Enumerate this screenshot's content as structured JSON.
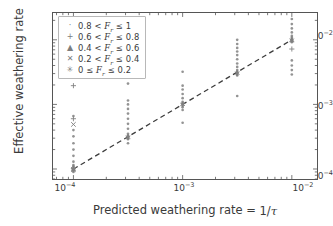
{
  "chart_data": {
    "type": "scatter",
    "title": "",
    "xlabel": "Predicted weathering rate = 1/τ",
    "ylabel": "Effective weathering rate",
    "xscale": "log",
    "yscale": "log",
    "xlim": [
      6.5e-05,
      0.017
    ],
    "ylim": [
      7e-05,
      0.026
    ],
    "grid": false,
    "xticks": [
      0.0001,
      0.001,
      0.01
    ],
    "xtick_labels": [
      "10⁻⁴",
      "10⁻³",
      "10⁻²"
    ],
    "yticks": [
      0.0001,
      0.001,
      0.01
    ],
    "ytick_labels": [
      "10⁻⁴",
      "10⁻³",
      "10⁻²"
    ],
    "legend_position": "upper left",
    "reference_line": {
      "style": "dashed",
      "color": "#3c3c3c",
      "description": "one-to-one line y = x",
      "x": [
        0.0001,
        0.01
      ],
      "y": [
        0.0001,
        0.01
      ]
    },
    "marker_color": "#808080",
    "series": [
      {
        "name": "0.8 < F_r ≤ 1",
        "marker": "point",
        "glyph": "·",
        "points": [
          [
            0.0001,
            0.0001
          ],
          [
            0.0001,
            0.000105
          ],
          [
            0.0001,
            9.3e-05
          ],
          [
            0.0001,
            0.00011
          ],
          [
            0.0001,
            9.7e-05
          ],
          [
            0.0001,
            0.0001
          ],
          [
            0.0001,
            0.000115
          ],
          [
            0.0001,
            9e-05
          ],
          [
            0.0001,
            0.00013
          ],
          [
            0.0001,
            0.00016
          ],
          [
            0.0001,
            0.0002
          ],
          [
            0.0001,
            0.00025
          ],
          [
            0.0001,
            0.00032
          ],
          [
            0.0001,
            0.0004
          ],
          [
            0.0001,
            0.00066
          ],
          [
            0.000316,
            0.00031
          ],
          [
            0.000316,
            0.00032
          ],
          [
            0.000316,
            0.0003
          ],
          [
            0.000316,
            0.00033
          ],
          [
            0.000316,
            0.00029
          ],
          [
            0.000316,
            0.000315
          ],
          [
            0.000316,
            0.00025
          ],
          [
            0.000316,
            0.00035
          ],
          [
            0.000316,
            0.00042
          ],
          [
            0.000316,
            0.0005
          ],
          [
            0.000316,
            0.0006
          ],
          [
            0.000316,
            0.00072
          ],
          [
            0.000316,
            0.00085
          ],
          [
            0.000316,
            0.001
          ],
          [
            0.000316,
            0.00115
          ],
          [
            0.000316,
            0.0021
          ],
          [
            0.001,
            0.001
          ],
          [
            0.001,
            0.00102
          ],
          [
            0.001,
            0.00095
          ],
          [
            0.001,
            0.00105
          ],
          [
            0.001,
            0.0009
          ],
          [
            0.001,
            0.0011
          ],
          [
            0.001,
            0.00082
          ],
          [
            0.001,
            0.00125
          ],
          [
            0.001,
            0.00145
          ],
          [
            0.001,
            0.0017
          ],
          [
            0.001,
            0.00195
          ],
          [
            0.001,
            0.0032
          ],
          [
            0.001,
            0.00052
          ],
          [
            0.00316,
            0.003
          ],
          [
            0.00316,
            0.0031
          ],
          [
            0.00316,
            0.0029
          ],
          [
            0.00316,
            0.0032
          ],
          [
            0.00316,
            0.0028
          ],
          [
            0.00316,
            0.0034
          ],
          [
            0.00316,
            0.0038
          ],
          [
            0.00316,
            0.0043
          ],
          [
            0.00316,
            0.005
          ],
          [
            0.00316,
            0.0058
          ],
          [
            0.00316,
            0.0066
          ],
          [
            0.00316,
            0.0075
          ],
          [
            0.00316,
            0.0086
          ],
          [
            0.00316,
            0.01
          ],
          [
            0.00316,
            0.00135
          ],
          [
            0.01,
            0.01
          ],
          [
            0.01,
            0.0102
          ],
          [
            0.01,
            0.0096
          ],
          [
            0.01,
            0.0108
          ],
          [
            0.01,
            0.0092
          ],
          [
            0.01,
            0.0115
          ],
          [
            0.01,
            0.013
          ],
          [
            0.01,
            0.015
          ],
          [
            0.01,
            0.0175
          ],
          [
            0.01,
            0.021
          ],
          [
            0.01,
            0.0048
          ],
          [
            0.01,
            0.004
          ],
          [
            0.01,
            0.0034
          ],
          [
            0.01,
            0.0029
          ]
        ]
      },
      {
        "name": "0.6 < F_r ≤ 0.8",
        "marker": "plus",
        "glyph": "+",
        "points": [
          [
            0.0001,
            0.00195
          ],
          [
            0.0001,
            0.0006
          ],
          [
            0.0001,
            0.000102
          ],
          [
            0.01,
            0.0072
          ]
        ]
      },
      {
        "name": "0.4 < F_r ≤ 0.6",
        "marker": "triangle",
        "glyph": "▲",
        "points": [
          [
            0.0001,
            0.0001
          ],
          [
            0.01,
            0.0098
          ]
        ]
      },
      {
        "name": "0.2 < F_r ≤ 0.4",
        "marker": "x",
        "glyph": "✕",
        "points": [
          [
            0.0001,
            0.00049
          ],
          [
            0.0001,
            9.8e-05
          ]
        ]
      },
      {
        "name": "0 ≤ F_r ≤ 0.2",
        "marker": "star",
        "glyph": "✳",
        "points": [
          [
            0.0001,
            0.0001
          ],
          [
            0.000316,
            0.00031
          ],
          [
            0.001,
            0.001
          ],
          [
            0.00316,
            0.00305
          ],
          [
            0.01,
            0.0099
          ]
        ]
      }
    ]
  },
  "axes": {
    "ylabel": "Effective weathering rate",
    "xlabel_prefix": "Predicted weathering rate = ",
    "xlabel_numerator": "1",
    "xlabel_denominator": "τ",
    "ytick_labels": [
      {
        "mantissa": "10",
        "exponent": "−2"
      },
      {
        "mantissa": "10",
        "exponent": "−3"
      },
      {
        "mantissa": "10",
        "exponent": "−4"
      }
    ],
    "xtick_labels": [
      {
        "mantissa": "10",
        "exponent": "−4"
      },
      {
        "mantissa": "10",
        "exponent": "−3"
      },
      {
        "mantissa": "10",
        "exponent": "−2"
      }
    ]
  },
  "legend": {
    "entries": [
      {
        "glyph": "·",
        "prefix": "0.8 <",
        "var": "F",
        "sub": "r",
        "rel": " ≤ 1"
      },
      {
        "glyph": "+",
        "prefix": "0.6 <",
        "var": "F",
        "sub": "r",
        "rel": " ≤ 0.8"
      },
      {
        "glyph": "▲",
        "prefix": "0.4 <",
        "var": "F",
        "sub": "r",
        "rel": " ≤ 0.6"
      },
      {
        "glyph": "✕",
        "prefix": "0.2 <",
        "var": "F",
        "sub": "r",
        "rel": " ≤ 0.4"
      },
      {
        "glyph": "✳",
        "prefix": "0 ≤",
        "var": "F",
        "sub": "r",
        "rel": " ≤ 0.2"
      }
    ]
  },
  "colors": {
    "marker": "#808080",
    "line": "#3c3c3c",
    "axis": "#555555",
    "text": "#3a3a3a",
    "background": "#ffffff"
  }
}
